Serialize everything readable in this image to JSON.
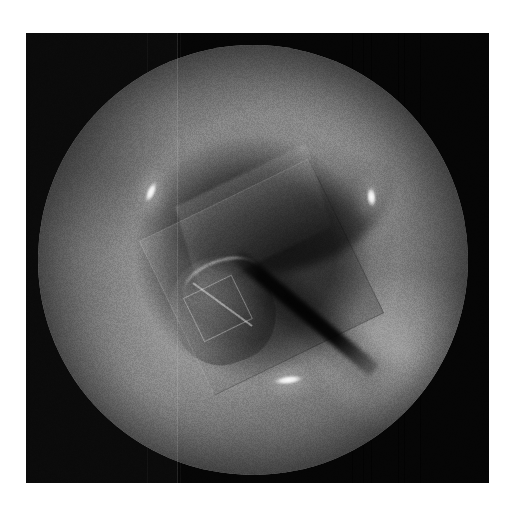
{
  "image": {
    "modality": "grayscale-endoscopic-frame",
    "title": "Grayscale Endoscopic Frame",
    "page_background": "#ffffff",
    "matte_color": "#050505",
    "frame": {
      "x": 26,
      "y": 33,
      "width": 463,
      "height": 450
    },
    "field_of_view": {
      "shape": "circle",
      "center_x": 252,
      "center_y": 260,
      "radius": 215,
      "base_color": "#6a6a6a"
    },
    "scan_seam": {
      "label": "vertical-sensor-seam",
      "x": 177,
      "color": "#ffffff"
    },
    "structures": [
      {
        "name": "torus-ridge",
        "label": "Annular tissue ridge",
        "tone": "mid-grey"
      },
      {
        "name": "lumen",
        "label": "Central cavity opening",
        "tone": "dark"
      },
      {
        "name": "shadow-arc",
        "label": "Upper inner-wall shadow",
        "tone": "near-black"
      },
      {
        "name": "cube-body",
        "label": "Rotated cuboid object",
        "tone": "mid-grey"
      },
      {
        "name": "knob",
        "label": "Rounded protrusion",
        "tone": "light-grey"
      },
      {
        "name": "blade",
        "label": "Dark diagonal edge",
        "tone": "black"
      }
    ],
    "speculars": [
      {
        "name": "spec-left",
        "label": "Left specular highlight",
        "x": 152,
        "y": 188
      },
      {
        "name": "spec-right",
        "label": "Right specular highlight",
        "x": 375,
        "y": 194
      },
      {
        "name": "spec-bottom",
        "label": "Bottom specular highlight",
        "x": 281,
        "y": 381
      }
    ],
    "streaks": [
      {
        "name": "streak-1",
        "x": 352,
        "tone": "dark"
      },
      {
        "name": "streak-2",
        "x": 363,
        "tone": "dark"
      },
      {
        "name": "streak-3",
        "x": 371,
        "tone": "dark"
      },
      {
        "name": "streak-4",
        "x": 398,
        "tone": "dark"
      },
      {
        "name": "streak-5",
        "x": 404,
        "tone": "dark"
      },
      {
        "name": "streak-6",
        "x": 420,
        "tone": "dark"
      },
      {
        "name": "streak-7",
        "x": 147,
        "tone": "light"
      },
      {
        "name": "streak-8",
        "x": 180,
        "tone": "light"
      }
    ],
    "caption": "Monochrome wide-angle endoscopic still: a circular field of view shows an annular tissue ridge surrounding a dark central cavity, with a rotated cuboid instrument and a rounded protrusion at centre, a dark diagonal edge crossing to the lower left, and three bright specular reflections."
  }
}
